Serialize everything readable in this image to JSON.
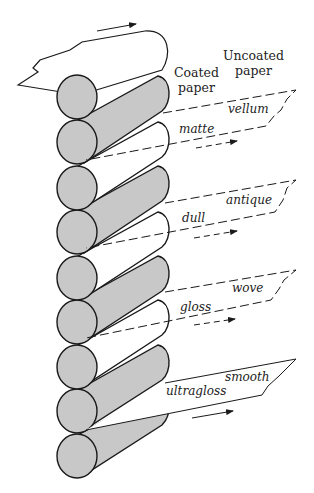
{
  "figure": {
    "headers": {
      "coated": [
        "Coated",
        "paper"
      ],
      "uncoated": [
        "Uncoated",
        "paper"
      ]
    },
    "colors": {
      "roll_fill": "#c8c8c8",
      "line": "#1a1a1a",
      "background": "#ffffff"
    },
    "coated_finishes": [
      {
        "label": "matte",
        "x": 179,
        "y": 123
      },
      {
        "label": "dull",
        "x": 182,
        "y": 212
      },
      {
        "label": "gloss",
        "x": 180,
        "y": 301
      },
      {
        "label": "ultragloss",
        "x": 166,
        "y": 385
      }
    ],
    "uncoated_finishes": [
      {
        "label": "vellum",
        "x": 228,
        "y": 103
      },
      {
        "label": "antique",
        "x": 226,
        "y": 194
      },
      {
        "label": "wove",
        "x": 232,
        "y": 282
      },
      {
        "label": "smooth",
        "x": 225,
        "y": 371
      }
    ]
  }
}
